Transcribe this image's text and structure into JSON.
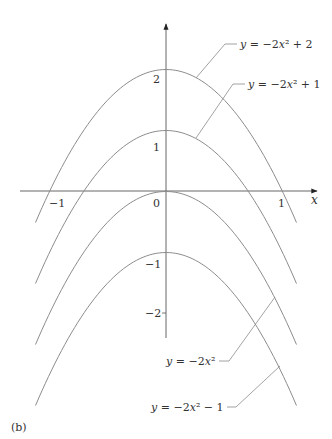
{
  "panel_label": "(b)",
  "chart_data": {
    "type": "line",
    "title": "",
    "xlabel": "x",
    "ylabel": "",
    "xlim": [
      -1.12,
      1.12
    ],
    "ylim": [
      -2.4,
      2.6
    ],
    "grid": false,
    "legend_position": "inline-annotations",
    "x_ticks": [
      {
        "value": -1,
        "label": "−1"
      },
      {
        "value": 0,
        "label": "0"
      },
      {
        "value": 1,
        "label": "1"
      }
    ],
    "y_ticks": [
      {
        "value": 2,
        "label": "2"
      },
      {
        "value": 1,
        "label": "1"
      },
      {
        "value": -1,
        "label": "−1"
      },
      {
        "value": -2,
        "label": "−2"
      }
    ],
    "series": [
      {
        "name": "y = −2x² + 2",
        "a": -2,
        "c": 2,
        "vertex": [
          0,
          2
        ],
        "x_roots": [
          -1,
          1
        ],
        "label_parts": [
          "y",
          " = −2",
          "x",
          "² + 2"
        ]
      },
      {
        "name": "y = −2x² + 1",
        "a": -2,
        "c": 1,
        "vertex": [
          0,
          1
        ],
        "x_roots": [
          -0.707,
          0.707
        ],
        "label_parts": [
          "y",
          " = −2",
          "x",
          "² + 1"
        ]
      },
      {
        "name": "y = −2x²",
        "a": -2,
        "c": 0,
        "vertex": [
          0,
          0
        ],
        "x_roots": [
          0
        ],
        "label_parts": [
          "y",
          " = −2",
          "x",
          "²"
        ]
      },
      {
        "name": "y = −2x² − 1",
        "a": -2,
        "c": -1,
        "vertex": [
          0,
          -1
        ],
        "x_roots": [],
        "label_parts": [
          "y",
          " = −2",
          "x",
          "² − 1"
        ]
      }
    ],
    "curve_color": "#8c8c8c",
    "axis_color": "#555555"
  }
}
